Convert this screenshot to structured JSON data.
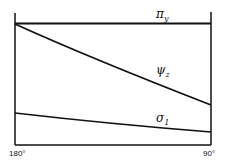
{
  "diagram": {
    "x_axis": {
      "left_label": "180°",
      "right_label": "90°"
    },
    "curves": [
      {
        "name": "pi_y",
        "symbol": "π",
        "subscript": "y",
        "shape": "horizontal line at top"
      },
      {
        "name": "psi_z",
        "symbol": "ψ",
        "subscript": "z",
        "shape": "decreasing from top-left to lower-right"
      },
      {
        "name": "sigma_1",
        "symbol": "σ",
        "subscript": "1",
        "shape": "slowly decreasing near bottom"
      }
    ]
  }
}
